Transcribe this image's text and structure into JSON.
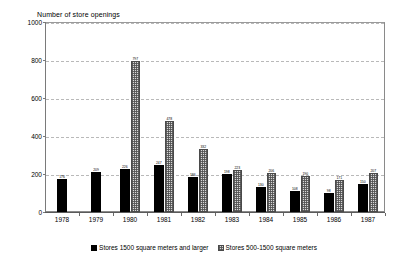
{
  "chart_data": {
    "type": "bar",
    "title": "Number of store openings",
    "xlabel": "",
    "ylabel": "",
    "ylim": [
      0,
      1000
    ],
    "yticks": [
      0,
      200,
      400,
      600,
      800,
      1000
    ],
    "ytick_labels": [
      "0",
      "200",
      "400",
      "600",
      "800",
      "1000"
    ],
    "grid": true,
    "legend_position": "bottom",
    "categories": [
      "1978",
      "1979",
      "1980",
      "1981",
      "1982",
      "1983",
      "1984",
      "1985",
      "1986",
      "1987"
    ],
    "series": [
      {
        "name": "Stores 1500 square meters and larger",
        "fill": "solid-black",
        "values": [
          176,
          209,
          226,
          247,
          186,
          198,
          130,
          108,
          98,
          150
        ],
        "labels": [
          "176",
          "209",
          "226",
          "247",
          "186",
          "198",
          "130",
          "108",
          "98",
          "150"
        ]
      },
      {
        "name": "Stores 500-1500 square meters",
        "fill": "dotted-grey",
        "values": [
          null,
          null,
          797,
          478,
          332,
          223,
          206,
          190,
          171,
          207
        ],
        "labels": [
          "",
          "",
          "797",
          "478",
          "332",
          "223",
          "206",
          "190",
          "171",
          "207"
        ]
      }
    ]
  },
  "legend": {
    "items": [
      {
        "label": "Stores 1500 square meters and larger",
        "swatch": "solid-black-swatch"
      },
      {
        "label": "Stores 500-1500 square meters",
        "swatch": "dotted-grey-swatch"
      }
    ]
  },
  "colors": {
    "series_1": "#000000",
    "series_2": "#d8d8d8",
    "grid": "#b9b9b9",
    "axis": "#7a7a7a",
    "background": "#ffffff"
  }
}
